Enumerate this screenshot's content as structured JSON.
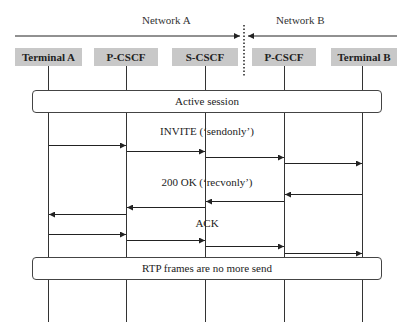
{
  "networks": [
    {
      "label": "Network A",
      "x": 162
    },
    {
      "label": "Network B",
      "x": 297
    }
  ],
  "nodes": [
    {
      "label": "Terminal A",
      "x": 48
    },
    {
      "label": "P-CSCF",
      "x": 126
    },
    {
      "label": "S-CSCF",
      "x": 205
    },
    {
      "label": "P-CSCF",
      "x": 284
    },
    {
      "label": "Terminal B",
      "x": 362
    }
  ],
  "bands": [
    {
      "label": "Active session",
      "y": 101
    },
    {
      "label": "RTP frames are no more send",
      "y": 268
    }
  ],
  "messages": [
    {
      "label": "INVITE (‘sendonly’)",
      "label_y": 132,
      "direction": "right",
      "ys": [
        145,
        151,
        157,
        163
      ]
    },
    {
      "label": "200 OK (‘recvonly’)",
      "label_y": 182,
      "direction": "left",
      "ys": [
        194,
        201,
        207,
        214
      ]
    },
    {
      "label": "ACK",
      "label_y": 223,
      "direction": "right",
      "ys": [
        234,
        240,
        246,
        253
      ]
    }
  ],
  "colors": {
    "node_fill": "#c8c8c8",
    "line": "#333333"
  }
}
